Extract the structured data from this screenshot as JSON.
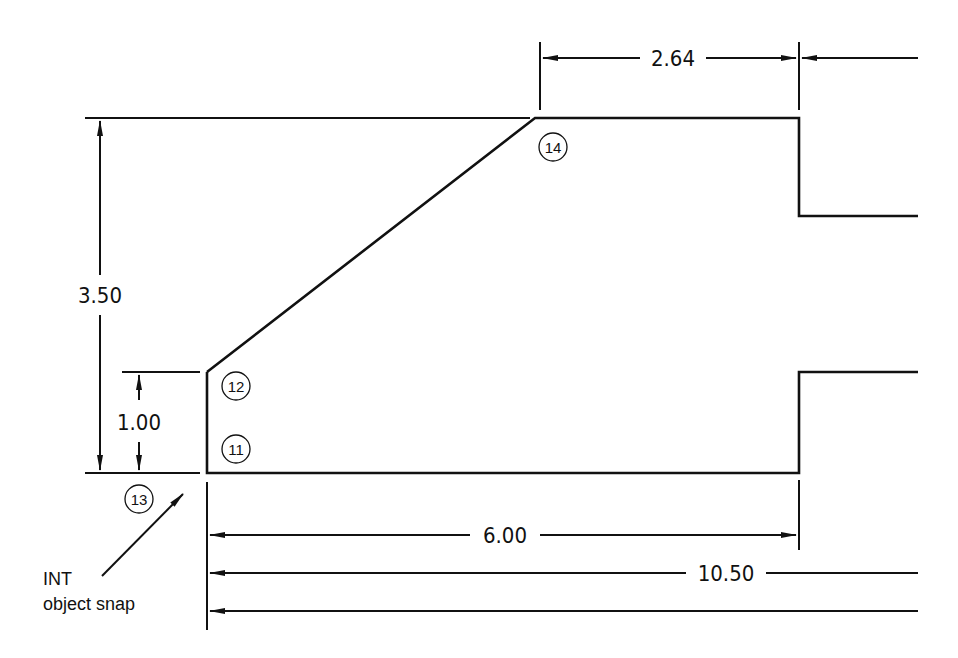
{
  "diagram": {
    "type": "technical drawing with dimensions",
    "dimensions": {
      "top_width": "2.64",
      "overall_height": "3.50",
      "step_height": "1.00",
      "base_length": "6.00",
      "overall_length": "10.50"
    },
    "callouts": [
      {
        "id": "11",
        "label": "11"
      },
      {
        "id": "12",
        "label": "12"
      },
      {
        "id": "13",
        "label": "13"
      },
      {
        "id": "14",
        "label": "14"
      }
    ],
    "annotation": {
      "line1": "INT",
      "line2": "object snap"
    },
    "colors": {
      "line": "#111111",
      "background": "#ffffff"
    }
  }
}
